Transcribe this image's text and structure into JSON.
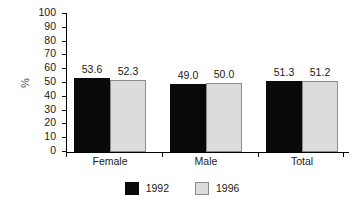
{
  "chart_data": {
    "type": "bar",
    "title": "",
    "subtitle": "",
    "xlabel": "",
    "ylabel": "%",
    "categories": [
      "Female",
      "Male",
      "Total"
    ],
    "series": [
      {
        "name": "1992",
        "color": "#0a0a0a",
        "values": [
          53.6,
          49.0,
          51.3
        ],
        "labels": [
          "53.6",
          "49.0",
          "51.3"
        ]
      },
      {
        "name": "1996",
        "color": "#dcdcdc",
        "values": [
          52.3,
          50.0,
          51.2
        ],
        "labels": [
          "52.3",
          "50.0",
          "51.2"
        ]
      }
    ],
    "ylim": [
      0,
      100
    ],
    "yticks": [
      0,
      10,
      20,
      30,
      40,
      50,
      60,
      70,
      80,
      90,
      100
    ],
    "ytick_labels": [
      "0",
      "10",
      "20",
      "30",
      "40",
      "50",
      "60",
      "70",
      "80",
      "90",
      "100"
    ],
    "grid": false,
    "legend_position": "bottom",
    "annotations": []
  },
  "legend": {
    "items": [
      {
        "label": "1992",
        "color": "#0a0a0a"
      },
      {
        "label": "1996",
        "color": "#dcdcdc"
      }
    ]
  },
  "axis": {
    "y_label": "%"
  }
}
